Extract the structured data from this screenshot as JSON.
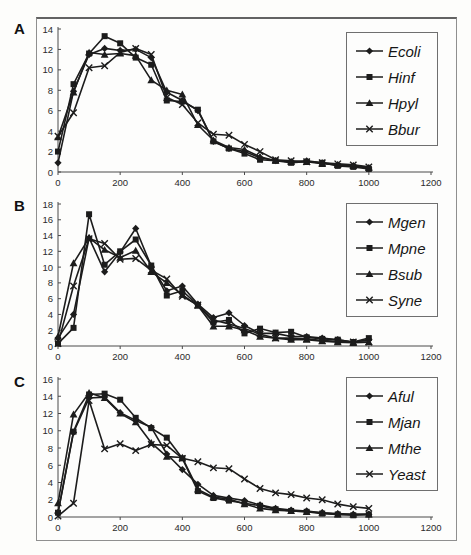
{
  "figure": {
    "background": "#fdfdfb",
    "line_color": "#1c1c1c",
    "frame_color": "#8f8f8f",
    "text_color": "#2b2b2b"
  },
  "chart_data": [
    {
      "type": "line",
      "panel_label": "A",
      "title": "",
      "xlabel": "",
      "ylabel": "",
      "grid": false,
      "legend_position": "top-right",
      "xlim": [
        0,
        1200
      ],
      "xticks": [
        0,
        200,
        400,
        600,
        800,
        1000,
        1200
      ],
      "ylim": [
        0,
        14
      ],
      "yticks": [
        0,
        2,
        4,
        6,
        8,
        10,
        12,
        14
      ],
      "x": [
        0,
        50,
        100,
        150,
        200,
        250,
        300,
        350,
        400,
        450,
        500,
        550,
        600,
        650,
        700,
        750,
        800,
        850,
        900,
        950,
        1000
      ],
      "series": [
        {
          "name": "Ecoli",
          "marker": "diamond",
          "values": [
            0.9,
            7.9,
            11.5,
            12.1,
            11.9,
            12.0,
            11.2,
            7.8,
            7.0,
            6.0,
            3.0,
            2.3,
            2.0,
            1.4,
            1.1,
            1.0,
            1.1,
            0.9,
            0.7,
            0.6,
            0.4
          ]
        },
        {
          "name": "Hinf",
          "marker": "square",
          "values": [
            2.0,
            8.6,
            11.6,
            13.3,
            12.6,
            11.2,
            10.5,
            7.0,
            6.9,
            6.1,
            3.0,
            2.3,
            1.8,
            1.2,
            1.1,
            0.9,
            1.0,
            0.9,
            0.6,
            0.5,
            0.3
          ]
        },
        {
          "name": "Hpyl",
          "marker": "triangle",
          "values": [
            3.4,
            7.8,
            11.7,
            11.5,
            11.6,
            11.4,
            9.0,
            8.0,
            7.6,
            4.6,
            3.1,
            2.4,
            2.2,
            1.5,
            1.1,
            1.0,
            1.0,
            0.8,
            0.7,
            0.6,
            0.4
          ]
        },
        {
          "name": "Bbur",
          "marker": "x",
          "values": [
            3.5,
            5.8,
            10.2,
            10.4,
            11.7,
            12.1,
            11.5,
            7.3,
            6.6,
            4.8,
            3.7,
            3.6,
            2.7,
            2.0,
            1.2,
            1.1,
            1.0,
            0.9,
            0.8,
            0.7,
            0.5
          ]
        }
      ]
    },
    {
      "type": "line",
      "panel_label": "B",
      "title": "",
      "xlabel": "",
      "ylabel": "",
      "grid": false,
      "legend_position": "top-right",
      "xlim": [
        0,
        1200
      ],
      "xticks": [
        0,
        200,
        400,
        600,
        800,
        1000,
        1200
      ],
      "ylim": [
        0,
        18
      ],
      "yticks": [
        0,
        2,
        4,
        6,
        8,
        10,
        12,
        14,
        16,
        18
      ],
      "x": [
        0,
        50,
        100,
        150,
        200,
        250,
        300,
        350,
        400,
        450,
        500,
        550,
        600,
        650,
        700,
        750,
        800,
        850,
        900,
        950,
        1000
      ],
      "series": [
        {
          "name": "Mgen",
          "marker": "diamond",
          "values": [
            1.0,
            4.0,
            13.7,
            9.4,
            11.9,
            14.9,
            10.1,
            7.0,
            7.6,
            5.3,
            3.6,
            4.2,
            2.6,
            1.6,
            1.6,
            1.2,
            1.2,
            1.0,
            0.8,
            0.5,
            0.8
          ]
        },
        {
          "name": "Mpne",
          "marker": "square",
          "values": [
            0.3,
            2.3,
            16.7,
            10.3,
            12.0,
            13.5,
            10.2,
            6.4,
            7.0,
            5.2,
            3.0,
            3.3,
            1.6,
            2.2,
            1.7,
            1.8,
            1.1,
            0.9,
            0.8,
            0.5,
            1.0
          ]
        },
        {
          "name": "Bsub",
          "marker": "triangle",
          "values": [
            1.2,
            10.5,
            13.7,
            12.2,
            11.2,
            12.1,
            9.4,
            8.0,
            6.5,
            5.1,
            2.5,
            2.5,
            2.0,
            1.2,
            1.0,
            0.8,
            0.8,
            0.6,
            0.5,
            0.4,
            0.5
          ]
        },
        {
          "name": "Syne",
          "marker": "x",
          "values": [
            0.3,
            7.6,
            13.6,
            13.0,
            11.0,
            11.1,
            9.6,
            8.5,
            6.3,
            5.2,
            3.3,
            2.8,
            2.2,
            1.5,
            1.0,
            1.0,
            0.9,
            0.7,
            0.6,
            0.5,
            0.5
          ]
        }
      ]
    },
    {
      "type": "line",
      "panel_label": "C",
      "title": "",
      "xlabel": "",
      "ylabel": "",
      "grid": false,
      "legend_position": "top-right",
      "xlim": [
        0,
        1200
      ],
      "xticks": [
        0,
        200,
        400,
        600,
        800,
        1000,
        1200
      ],
      "ylim": [
        0,
        16
      ],
      "yticks": [
        0,
        2,
        4,
        6,
        8,
        10,
        12,
        14,
        16
      ],
      "x": [
        0,
        50,
        100,
        150,
        200,
        250,
        300,
        350,
        400,
        450,
        500,
        550,
        600,
        650,
        700,
        750,
        800,
        850,
        900,
        950,
        1000
      ],
      "series": [
        {
          "name": "Aful",
          "marker": "diamond",
          "values": [
            0.5,
            9.8,
            13.8,
            13.9,
            12.1,
            11.2,
            10.4,
            7.3,
            5.5,
            3.8,
            2.5,
            2.2,
            1.9,
            1.4,
            1.0,
            0.8,
            0.7,
            0.5,
            0.4,
            0.3,
            0.3
          ]
        },
        {
          "name": "Mjan",
          "marker": "square",
          "values": [
            0.5,
            9.9,
            14.2,
            14.3,
            13.6,
            11.5,
            10.3,
            9.2,
            6.8,
            3.0,
            2.2,
            1.9,
            1.6,
            1.3,
            0.9,
            0.7,
            0.6,
            0.4,
            0.3,
            0.2,
            0.3
          ]
        },
        {
          "name": "Mthe",
          "marker": "triangle",
          "values": [
            1.6,
            11.9,
            14.4,
            13.8,
            12.0,
            11.0,
            8.6,
            7.0,
            6.9,
            3.2,
            2.3,
            2.1,
            1.5,
            1.0,
            0.8,
            0.7,
            0.6,
            0.5,
            0.3,
            0.3,
            0.3
          ]
        },
        {
          "name": "Yeast",
          "marker": "x",
          "values": [
            0.1,
            1.6,
            13.5,
            7.9,
            8.5,
            7.7,
            8.4,
            8.3,
            6.8,
            6.4,
            5.7,
            5.6,
            4.4,
            3.3,
            2.8,
            2.6,
            2.2,
            2.0,
            1.5,
            1.2,
            1.0
          ]
        }
      ]
    }
  ]
}
